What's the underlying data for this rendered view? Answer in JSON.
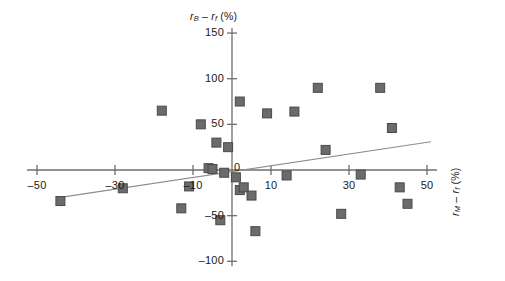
{
  "chart_data": {
    "type": "scatter",
    "title": "",
    "subtitle": "",
    "ylabel": "rB - rf (%)",
    "xlabel": "rM - rf (%)",
    "xlabel_parts": {
      "lead": "r",
      "lead_sub": "M",
      "minus": " – ",
      "trail": "r",
      "trail_sub": "f",
      "unit": " (%)"
    },
    "ylabel_parts": {
      "lead": "r",
      "lead_sub": "B",
      "minus": " – ",
      "trail": "r",
      "trail_sub": "f",
      "unit": " (%)"
    },
    "xlim": [
      -60,
      55
    ],
    "ylim": [
      -110,
      160
    ],
    "xticks": [
      -50,
      -30,
      -10,
      0,
      10,
      30,
      50
    ],
    "xtick_labels": [
      "–50",
      "–30",
      "–10",
      "0",
      "10",
      "30",
      "50"
    ],
    "yticks": [
      150,
      100,
      50,
      0,
      -50,
      -100
    ],
    "ytick_labels": [
      "150",
      "100",
      "50",
      "0",
      "–50",
      "–100"
    ],
    "grid": false,
    "legend": null,
    "marker": {
      "shape": "square",
      "color": "#6b6b6b",
      "edge_color": "#4a4a4a",
      "size": 9
    },
    "trendline": {
      "show": true,
      "color": "#8c8c8c",
      "x_start": -44,
      "y_start": -30,
      "x_end": 51,
      "y_end": 31
    },
    "points": [
      {
        "x": -44,
        "y": -34
      },
      {
        "x": -28,
        "y": -20
      },
      {
        "x": -18,
        "y": 65
      },
      {
        "x": -13,
        "y": -42
      },
      {
        "x": -11,
        "y": -18
      },
      {
        "x": -8,
        "y": 50
      },
      {
        "x": -6,
        "y": 2
      },
      {
        "x": -5,
        "y": 1
      },
      {
        "x": -4,
        "y": 30
      },
      {
        "x": -3,
        "y": -55
      },
      {
        "x": -2,
        "y": -3
      },
      {
        "x": -1,
        "y": 25
      },
      {
        "x": 1,
        "y": -8
      },
      {
        "x": 2,
        "y": 75
      },
      {
        "x": 2,
        "y": -22
      },
      {
        "x": 3,
        "y": -19
      },
      {
        "x": 5,
        "y": -28
      },
      {
        "x": 6,
        "y": -67
      },
      {
        "x": 9,
        "y": 62
      },
      {
        "x": 14,
        "y": -6
      },
      {
        "x": 16,
        "y": 64
      },
      {
        "x": 22,
        "y": 90
      },
      {
        "x": 24,
        "y": 22
      },
      {
        "x": 28,
        "y": -48
      },
      {
        "x": 33,
        "y": -5
      },
      {
        "x": 38,
        "y": 90
      },
      {
        "x": 41,
        "y": 46
      },
      {
        "x": 43,
        "y": -19
      },
      {
        "x": 45,
        "y": -37
      }
    ]
  },
  "axes": {
    "origin_px": {
      "x": 232,
      "y": 170
    },
    "x_scale_px_per_unit": 3.9,
    "y_scale_px_per_unit": 0.913
  }
}
